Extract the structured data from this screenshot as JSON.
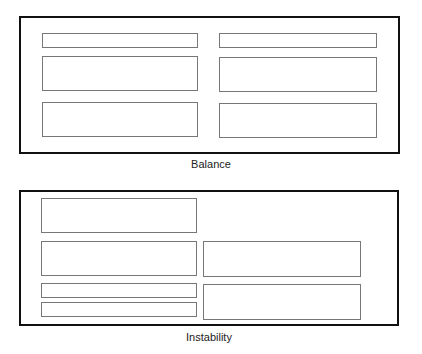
{
  "diagrams": [
    {
      "caption": "Balance"
    },
    {
      "caption": "Instability"
    }
  ]
}
